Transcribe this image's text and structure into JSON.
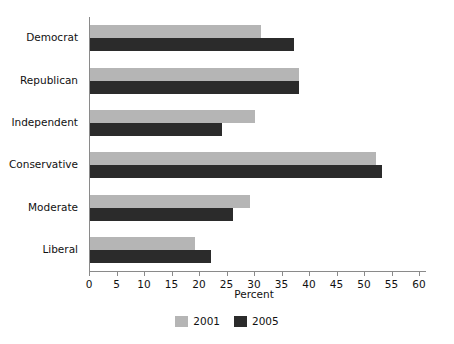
{
  "chart_data": {
    "type": "bar",
    "orientation": "horizontal",
    "title": "",
    "xlabel": "Percent",
    "ylabel": "",
    "xlim": [
      0,
      60
    ],
    "xticks": [
      0,
      5,
      10,
      15,
      20,
      25,
      30,
      35,
      40,
      45,
      50,
      55,
      60
    ],
    "xtick_labels": [
      "0",
      "5",
      "10",
      "15",
      "20",
      "25",
      "30",
      "35",
      "40",
      "45",
      "50",
      "55",
      "60"
    ],
    "grid": false,
    "legend_position": "bottom-center",
    "categories": [
      "Democrat",
      "Republican",
      "Independent",
      "Conservative",
      "Moderate",
      "Liberal"
    ],
    "series": [
      {
        "name": "2001",
        "color": "#b5b5b5",
        "values": [
          31,
          38,
          30,
          52,
          29,
          19
        ]
      },
      {
        "name": "2005",
        "color": "#2b2b2b",
        "values": [
          37,
          38,
          24,
          53,
          26,
          22
        ]
      }
    ]
  },
  "axis": {
    "x_title": "Percent"
  },
  "legend": {
    "entries": [
      {
        "label": "2001",
        "color": "#b5b5b5"
      },
      {
        "label": "2005",
        "color": "#2b2b2b"
      }
    ]
  },
  "colors": {
    "series_2001": "#b5b5b5",
    "series_2005": "#2b2b2b",
    "axis": "#8a8a8a",
    "text": "#111111",
    "background": "#ffffff"
  }
}
